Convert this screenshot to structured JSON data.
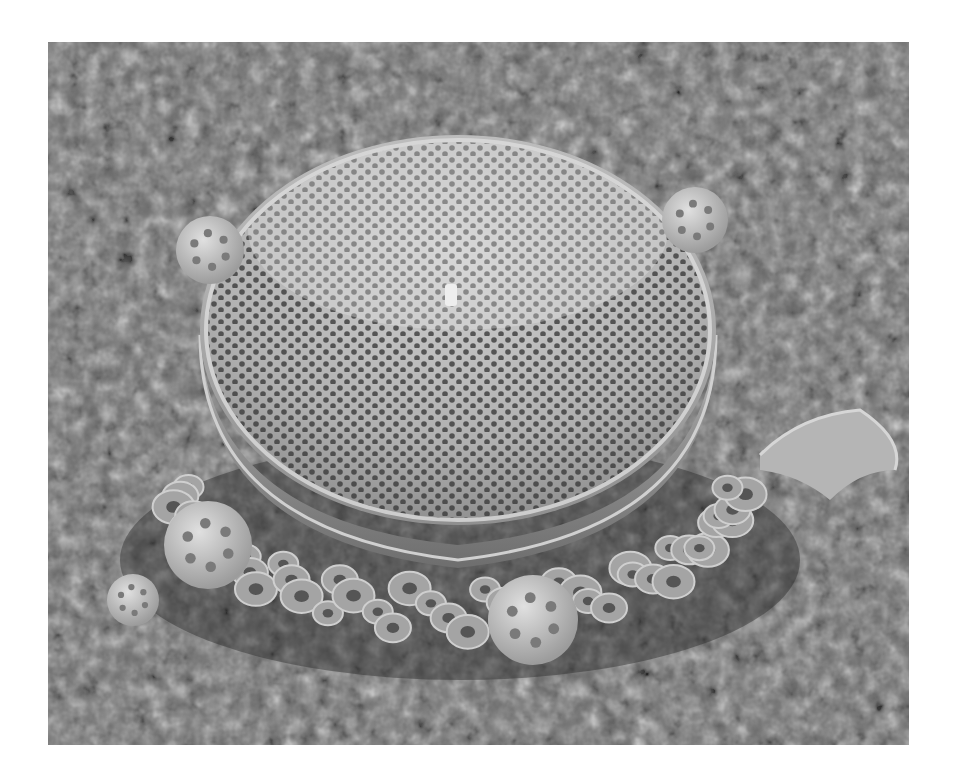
{
  "image": {
    "subject": "scanning electron micrograph of a centric diatom frustule surrounded by coccoliths",
    "mode": "grayscale",
    "frame": {
      "left": 48,
      "top": 42,
      "width": 861,
      "height": 703
    },
    "colors": {
      "page_background": "#ffffff",
      "substrate_mid": "#6a6a6a",
      "substrate_dark": "#2e2e2e",
      "substrate_light": "#9a9a9a",
      "valve_face": "#b9b9b9",
      "valve_highlight": "#dcdcdc",
      "areola": "#3a3a3a",
      "girdle_band": "#8e8e8e",
      "girdle_rim": "#cfcfcf",
      "coccolith": "#a8a8a8",
      "coccosphere": "#c6c6c6"
    },
    "diatom": {
      "cx": 458,
      "cy": 330,
      "rx": 258,
      "ry": 195,
      "girdle_depth": 62
    },
    "coccospheres": [
      {
        "cx": 208,
        "cy": 545,
        "r": 44
      },
      {
        "cx": 533,
        "cy": 620,
        "r": 45
      },
      {
        "cx": 133,
        "cy": 600,
        "r": 26
      },
      {
        "cx": 210,
        "cy": 250,
        "r": 34
      },
      {
        "cx": 695,
        "cy": 220,
        "r": 33
      }
    ],
    "debris": {
      "cx": 830,
      "cy": 452,
      "rx": 75,
      "ry": 40
    }
  }
}
